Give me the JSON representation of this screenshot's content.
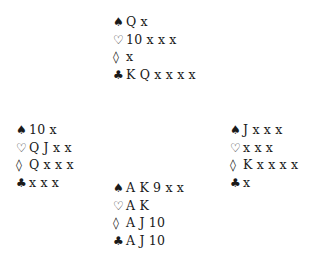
{
  "suit_symbols": {
    "spades": "♠",
    "hearts": "♡",
    "diamonds": "◊",
    "clubs": "♣"
  },
  "hands": {
    "north": {
      "spades": "Q x",
      "hearts": "10 x x x",
      "diamonds": "x",
      "clubs": "K Q x x x x"
    },
    "west": {
      "spades": "10 x",
      "hearts": "Q J x x",
      "diamonds": "Q x x x",
      "clubs": "x x x"
    },
    "east": {
      "spades": "J x x x",
      "hearts": "x x x",
      "diamonds": "K x x x x",
      "clubs": "x"
    },
    "south": {
      "spades": "A K 9 x x",
      "hearts": "A K",
      "diamonds": "A J 10",
      "clubs": "A J 10"
    }
  }
}
